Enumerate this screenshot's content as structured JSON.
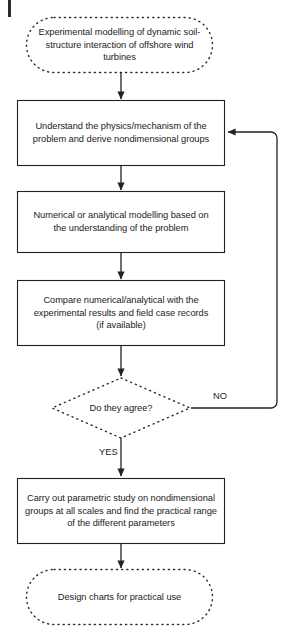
{
  "diagram": {
    "type": "flowchart",
    "orientation": "top-to-bottom",
    "title_present": false,
    "colors": {
      "stroke": "#222222",
      "text": "#1c1c1c",
      "background": "#ffffff"
    },
    "nodes": [
      {
        "id": "start",
        "shape": "terminator-dotted-rounded",
        "text": "Experimental modelling of dynamic soil-structure interaction of offshore wind turbines",
        "lines": [
          "Experimental modelling of dynamic",
          "soil-structure interaction of offshore",
          "wind turbines"
        ]
      },
      {
        "id": "understand",
        "shape": "process-rectangle",
        "text": "Understand the physics/mechanism of the problem and derive nondimensional groups",
        "lines": [
          "Understand the physics/mechanism of",
          "the problem and derive nondimensional",
          "groups"
        ]
      },
      {
        "id": "model",
        "shape": "process-rectangle",
        "text": "Numerical or analytical modelling based on the understanding of the problem",
        "lines": [
          "Numerical or analytical modelling based",
          "on the understanding of the problem"
        ]
      },
      {
        "id": "compare",
        "shape": "process-rectangle",
        "text": "Compare numerical/analytical with the experimental results and field case records (if available)",
        "lines": [
          "Compare numerical/analytical with the",
          "experimental results and field case",
          "records (if available)"
        ]
      },
      {
        "id": "decision",
        "shape": "decision-diamond-dotted",
        "text": "Do they agree?",
        "lines": [
          "Do they agree?"
        ]
      },
      {
        "id": "parametric",
        "shape": "process-rectangle",
        "text": "Carry out parametric study on nondimensional groups at all scales and find the practical range of the different parameters",
        "lines": [
          "Carry out parametric study on",
          "nondimensional groups at all scales and find",
          "the practical range of the different",
          "parameters"
        ]
      },
      {
        "id": "end",
        "shape": "terminator-dotted-rounded",
        "text": "Design charts for practical use",
        "lines": [
          "Design charts for practical use"
        ]
      }
    ],
    "edges": [
      {
        "id": "e1",
        "from": "start",
        "to": "understand",
        "label": ""
      },
      {
        "id": "e2",
        "from": "understand",
        "to": "model",
        "label": ""
      },
      {
        "id": "e3",
        "from": "model",
        "to": "compare",
        "label": ""
      },
      {
        "id": "e4",
        "from": "compare",
        "to": "decision",
        "label": ""
      },
      {
        "id": "e5",
        "from": "decision",
        "to": "understand",
        "label": "NO"
      },
      {
        "id": "e6",
        "from": "decision",
        "to": "parametric",
        "label": "YES"
      },
      {
        "id": "e7",
        "from": "parametric",
        "to": "end",
        "label": ""
      }
    ],
    "edge_labels": {
      "no": "NO",
      "yes": "YES"
    }
  }
}
